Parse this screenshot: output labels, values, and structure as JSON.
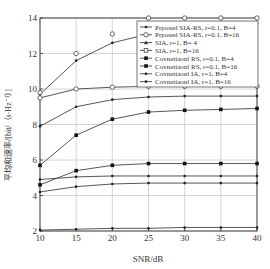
{
  "chart_data": {
    "type": "line",
    "title": "",
    "xlabel": "SNR/dB",
    "ylabel": "平均和速率/[bit/（s·Hz⁻¹）]",
    "x": [
      10,
      15,
      20,
      25,
      30,
      35,
      40
    ],
    "xticks": [
      "10",
      "15",
      "20",
      "25",
      "30",
      "35",
      "40"
    ],
    "yticks": [
      "2",
      "4",
      "6",
      "8",
      "10",
      "12",
      "14"
    ],
    "xlim": [
      10,
      40
    ],
    "ylim": [
      2,
      14
    ],
    "grid": true,
    "legend_position": "upper right",
    "series": [
      {
        "name": "Prposed SIA-RS, r=0.1, B=4",
        "marker": "dot",
        "values": [
          9.7,
          11.6,
          12.6,
          13.1,
          13.4,
          13.6,
          13.7
        ]
      },
      {
        "name": "Prposed SIA-RS, r=0.1, B=16",
        "marker": "circle",
        "line": false,
        "values": [
          9.8,
          12.0,
          13.1,
          14.0,
          14.0,
          14.0,
          14.0
        ]
      },
      {
        "name": "SIA, r=1, B=4",
        "marker": "circle",
        "values": [
          9.5,
          10.0,
          10.1,
          10.15,
          10.15,
          10.15,
          10.15
        ]
      },
      {
        "name": "SIA, r=1, B=16",
        "marker": "dot",
        "values": [
          7.9,
          9.0,
          9.4,
          9.55,
          9.6,
          9.6,
          9.6
        ]
      },
      {
        "name": "Covnetiaonl RS, r=0.1, B=4",
        "marker": "square",
        "values": [
          5.7,
          7.4,
          8.3,
          8.7,
          8.8,
          8.85,
          8.9
        ]
      },
      {
        "name": "Covnetiaonl RS, r=0.1, B=16",
        "marker": "square",
        "values": [
          4.6,
          5.4,
          5.7,
          5.8,
          5.8,
          5.8,
          5.8
        ]
      },
      {
        "name": "Covnetiaonl IA, r=1, B=4",
        "marker": "dot",
        "values": [
          4.9,
          5.05,
          5.1,
          5.1,
          5.1,
          5.1,
          5.1
        ]
      },
      {
        "name": "Covnetiaonl IA, r=1, B=16",
        "marker": "dot",
        "values": [
          4.2,
          4.5,
          4.65,
          4.7,
          4.7,
          4.7,
          4.7
        ]
      },
      {
        "name": "",
        "marker": "dot",
        "values": [
          2.05,
          2.1,
          2.15,
          2.15,
          2.2,
          2.2,
          2.2
        ]
      }
    ],
    "legend": [
      {
        "label": "Prposed SIA-RS, r=0.1, B=4",
        "marker": "dot"
      },
      {
        "label": "Prposed SIA-RS, r=0.1, B=16",
        "marker": "circle"
      },
      {
        "label": "SIA, r=1, B= 4",
        "marker": "triangle"
      },
      {
        "label": "SIA, r=1, B=16",
        "marker": "square-open"
      },
      {
        "label": "Covnetiaonl RS, r=0.1, B=4",
        "marker": "square"
      },
      {
        "label": "Covnetiaonl RS, r=0.1, B=16",
        "marker": "square"
      },
      {
        "label": "Covnetiaonl IA, r=1, B=4",
        "marker": "dot"
      },
      {
        "label": "Covnetiaonl IA, r=1, B=16",
        "marker": "dot"
      }
    ]
  },
  "colors": {
    "line": "#444444",
    "grid": "#cccccc",
    "axis": "#333333"
  }
}
